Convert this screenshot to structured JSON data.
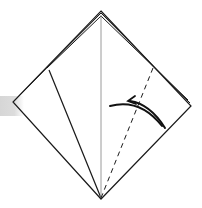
{
  "diagram": {
    "type": "origami-fold-step",
    "colors": {
      "background": "#ffffff",
      "line": "#1a1a1a",
      "centerline": "#9a9a9a",
      "shade": "#d8d8d8"
    },
    "shape": {
      "outer_diamond": {
        "top": [
          101,
          11
        ],
        "left": [
          13,
          102
        ],
        "right": [
          191,
          106
        ],
        "bottom": [
          101,
          199
        ]
      },
      "layered_top_offsets": 2
    },
    "lines": {
      "centerline": {
        "from": [
          101,
          14
        ],
        "to": [
          101,
          198
        ],
        "style": "solid-gray"
      },
      "inner_flap": {
        "from": [
          49,
          70
        ],
        "to": [
          101,
          198
        ],
        "style": "solid"
      },
      "valley_fold": {
        "from": [
          153,
          68
        ],
        "to": [
          101,
          198
        ],
        "style": "dashed"
      }
    },
    "arrow": {
      "direction": "left-up",
      "meaning": "fold flap along dashed line",
      "head": [
        128,
        100
      ]
    }
  }
}
